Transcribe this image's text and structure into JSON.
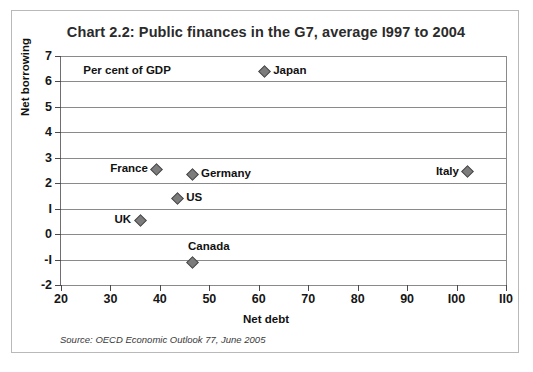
{
  "chart_data": {
    "type": "scatter",
    "title": "Chart 2.2: Public finances in the G7, average I997 to 2004",
    "xlabel": "Net debt",
    "ylabel": "Net borrowing",
    "units_note": "Per cent of GDP",
    "source": "Source: OECD Economic Outlook 77, June 2005",
    "xlim": [
      20,
      110
    ],
    "ylim": [
      -2,
      7
    ],
    "xticks": [
      20,
      30,
      40,
      50,
      60,
      70,
      80,
      90,
      100,
      110
    ],
    "yticks": [
      7,
      6,
      5,
      4,
      3,
      2,
      1,
      0,
      -1,
      -2
    ],
    "ytick_labels": [
      "7",
      "6",
      "5",
      "4",
      "3",
      "2",
      "I",
      "0",
      "-I",
      "-2"
    ],
    "grid": "horizontal",
    "legend": "none",
    "marker_color": "#7c7c7c",
    "marker_edge_color": "#4b4b4b",
    "points": [
      {
        "label": "Japan",
        "x": 61.1,
        "y": 6.4,
        "label_pos": "right"
      },
      {
        "label": "France",
        "x": 39.4,
        "y": 2.55,
        "label_pos": "left"
      },
      {
        "label": "Germany",
        "x": 46.5,
        "y": 2.35,
        "label_pos": "right"
      },
      {
        "label": "Italy",
        "x": 102.3,
        "y": 2.45,
        "label_pos": "left"
      },
      {
        "label": "US",
        "x": 43.5,
        "y": 1.4,
        "label_pos": "right"
      },
      {
        "label": "UK",
        "x": 36.0,
        "y": 0.55,
        "label_pos": "left"
      },
      {
        "label": "Canada",
        "x": 46.5,
        "y": -1.1,
        "label_pos": "above"
      }
    ]
  }
}
